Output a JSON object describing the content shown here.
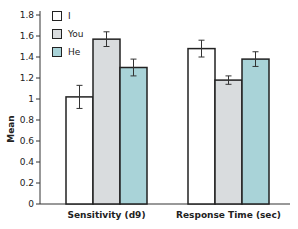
{
  "chart_data": {
    "type": "bar",
    "title": "",
    "xlabel": "",
    "ylabel": "Mean",
    "ylim": [
      0,
      1.8
    ],
    "yticks": [
      0,
      0.2,
      0.4,
      0.6,
      0.8,
      1,
      1.2,
      1.4,
      1.6,
      1.8
    ],
    "ytick_labels": [
      "0",
      "0.2",
      "0.4",
      "0.6",
      "0.8",
      "1",
      "1.2",
      "1.4",
      "1.6",
      "1.8"
    ],
    "categories": [
      "Sensitivity (d9)",
      "Response Time (sec)"
    ],
    "series": [
      {
        "name": "I",
        "color": "#ffffff",
        "values": [
          1.02,
          1.48
        ],
        "errors": [
          0.11,
          0.08
        ]
      },
      {
        "name": "You",
        "color": "#d9dcde",
        "values": [
          1.57,
          1.18
        ],
        "errors": [
          0.07,
          0.04
        ]
      },
      {
        "name": "He",
        "color": "#a9d3d8",
        "values": [
          1.3,
          1.38
        ],
        "errors": [
          0.08,
          0.07
        ]
      }
    ],
    "legend_position": "upper-left",
    "grid": false
  }
}
